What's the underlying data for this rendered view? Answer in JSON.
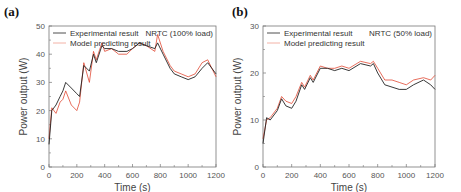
{
  "figure": {
    "panels": [
      {
        "label": "(a)",
        "annotation": "NRTC (100% load)"
      },
      {
        "label": "(b)",
        "annotation": "NRTC (50% load)"
      }
    ],
    "legend": [
      "Experimental result",
      "Model predicting result"
    ],
    "colors": {
      "experimental": "#222222",
      "model": "#e0402a"
    }
  },
  "chart_data": [
    {
      "type": "line",
      "title": "(a) NRTC (100% load)",
      "xlabel": "Time (s)",
      "ylabel": "Power output (W)",
      "xlim": [
        0,
        1200
      ],
      "ylim": [
        0,
        50
      ],
      "xticks": [
        0,
        200,
        400,
        600,
        800,
        1000,
        1200
      ],
      "yticks": [
        0,
        10,
        20,
        30,
        40,
        50
      ],
      "grid": false,
      "legend_position": "upper left",
      "annotations": [
        "NRTC (100% load)"
      ],
      "x": [
        0,
        20,
        50,
        80,
        100,
        120,
        160,
        200,
        220,
        250,
        290,
        320,
        340,
        380,
        400,
        450,
        500,
        560,
        600,
        650,
        700,
        760,
        780,
        820,
        870,
        900,
        950,
        1000,
        1050,
        1100,
        1140,
        1200
      ],
      "series": [
        {
          "name": "Experimental result",
          "values": [
            8,
            20,
            22,
            25,
            27,
            30,
            28,
            26,
            25,
            36,
            34,
            40,
            37,
            43,
            42,
            42,
            41,
            41,
            42,
            44,
            43,
            42,
            44,
            40,
            35,
            33,
            32,
            31,
            32,
            35,
            37,
            33
          ]
        },
        {
          "name": "Model predicting result",
          "values": [
            10,
            21,
            19,
            23,
            24,
            27,
            22,
            20,
            23,
            37,
            30,
            41,
            38,
            44,
            41,
            42,
            40,
            40,
            42,
            44,
            43,
            41,
            47,
            41,
            36,
            34,
            33,
            32,
            33,
            37,
            38,
            32
          ]
        }
      ]
    },
    {
      "type": "line",
      "title": "(b) NRTC (50% load)",
      "xlabel": "Time (s)",
      "ylabel": "Power output (W)",
      "xlim": [
        0,
        1200
      ],
      "ylim": [
        0,
        30
      ],
      "xticks": [
        0,
        200,
        400,
        600,
        800,
        1000,
        1200
      ],
      "yticks": [
        0,
        10,
        20,
        30
      ],
      "grid": false,
      "legend_position": "upper left",
      "annotations": [
        "NRTC (50% load)"
      ],
      "x": [
        0,
        25,
        50,
        100,
        130,
        160,
        200,
        230,
        270,
        290,
        330,
        350,
        400,
        450,
        500,
        550,
        600,
        680,
        750,
        770,
        800,
        850,
        900,
        950,
        1000,
        1050,
        1120,
        1170,
        1200
      ],
      "series": [
        {
          "name": "Experimental result",
          "values": [
            5,
            10.5,
            10,
            12,
            14.5,
            13,
            12.5,
            14,
            17.5,
            16.5,
            19,
            18,
            21,
            21,
            20.5,
            21,
            20.5,
            22,
            21.5,
            22,
            20,
            17.5,
            17,
            16.5,
            16.5,
            17.5,
            18.5,
            17.5,
            16.5
          ]
        },
        {
          "name": "Model predicting result",
          "values": [
            6,
            10,
            10.5,
            12.5,
            15,
            14,
            13.5,
            15,
            18,
            17,
            19.5,
            18.5,
            21.5,
            21,
            21,
            21.5,
            21,
            22.5,
            22,
            22.5,
            21,
            18.5,
            18.5,
            18,
            17.5,
            18.5,
            19,
            18.5,
            19.5
          ]
        }
      ]
    }
  ]
}
